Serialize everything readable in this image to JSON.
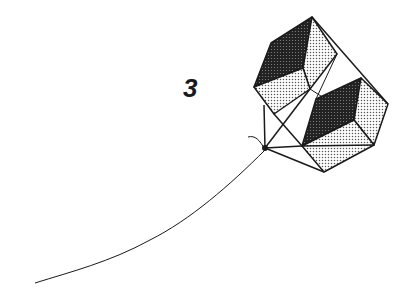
{
  "figure": {
    "number_label": "3"
  },
  "colors": {
    "background": "#ffffff",
    "ink": "#1a1a1a",
    "dark_face": "#2b2b2b",
    "light_face_dot": "#555555"
  }
}
